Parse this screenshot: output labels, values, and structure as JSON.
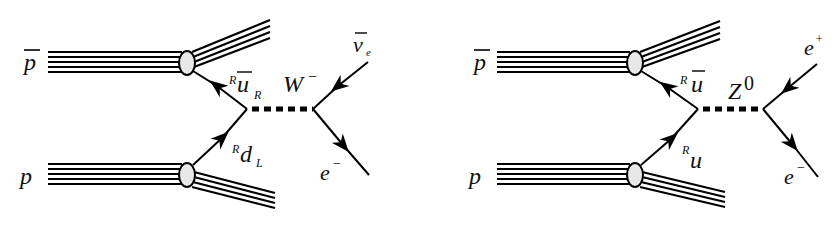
{
  "diagrams": [
    {
      "id": "w-production",
      "boson": {
        "symbol": "W",
        "charge": "−"
      },
      "incoming": {
        "top_hadron": "p",
        "top_bar": true,
        "bottom_hadron": "p"
      },
      "quarks": {
        "top": {
          "color": "R",
          "flavor": "u",
          "bar": true,
          "helicity": "R"
        },
        "bottom": {
          "color": "R",
          "flavor": "d",
          "bar": false,
          "helicity": "L"
        }
      },
      "leptons": {
        "top": {
          "symbol": "ν",
          "sub": "e",
          "bar": true
        },
        "bottom": {
          "symbol": "e",
          "sup": "−"
        }
      }
    },
    {
      "id": "z-production",
      "boson": {
        "symbol": "Z",
        "charge": "0"
      },
      "incoming": {
        "top_hadron": "p",
        "top_bar": true,
        "bottom_hadron": "p"
      },
      "quarks": {
        "top": {
          "color": "R",
          "flavor": "u",
          "bar": true,
          "helicity": ""
        },
        "bottom": {
          "color": "R",
          "flavor": "u",
          "bar": false,
          "helicity": ""
        }
      },
      "leptons": {
        "top": {
          "symbol": "e",
          "sup": "+"
        },
        "bottom": {
          "symbol": "e",
          "sup": "−"
        }
      }
    }
  ],
  "colors": {
    "line": "#000000",
    "blob_fill": "#e8e8e8",
    "background": "#ffffff"
  }
}
